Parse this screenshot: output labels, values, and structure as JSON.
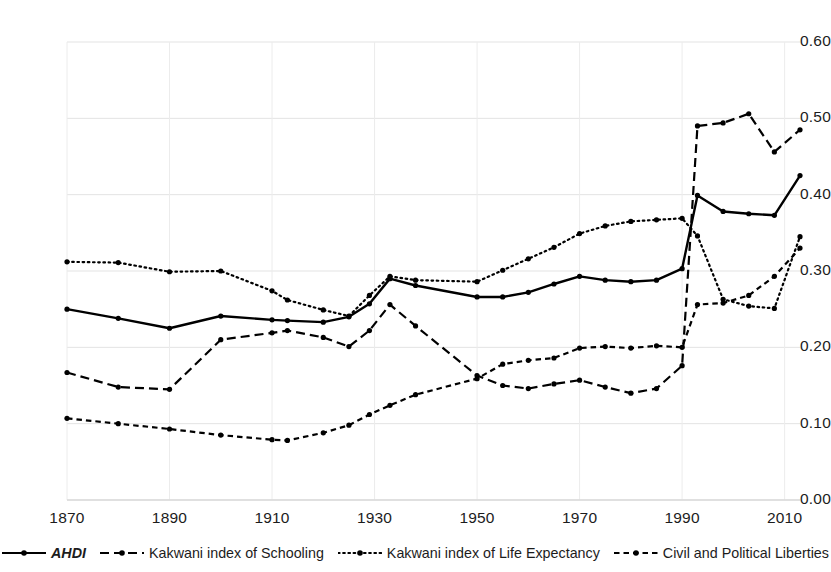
{
  "chart_data": {
    "type": "line",
    "title": "",
    "subtitle": "",
    "xlabel": "",
    "ylabel": "",
    "xlim": [
      1870,
      2013
    ],
    "ylim": [
      0.0,
      0.6
    ],
    "grid": true,
    "legend_position": "bottom",
    "y_ticks": [
      "0.00",
      "0.10",
      "0.20",
      "0.30",
      "0.40",
      "0.50",
      "0.60"
    ],
    "y_tick_values": [
      0.0,
      0.1,
      0.2,
      0.3,
      0.4,
      0.5,
      0.6
    ],
    "x_ticks": [
      "1870",
      "1890",
      "1910",
      "1930",
      "1950",
      "1970",
      "1990",
      "2010"
    ],
    "x_tick_values": [
      1870,
      1890,
      1910,
      1930,
      1950,
      1970,
      1990,
      2010
    ],
    "x": [
      1870,
      1880,
      1890,
      1900,
      1910,
      1913,
      1920,
      1925,
      1929,
      1933,
      1938,
      1950,
      1955,
      1960,
      1965,
      1970,
      1975,
      1980,
      1985,
      1990,
      1993,
      1998,
      2003,
      2008,
      2013
    ],
    "series": [
      {
        "name": "AHDI",
        "style": "solid",
        "marker": "circle",
        "color": "#000000",
        "values": [
          0.25,
          0.238,
          0.225,
          0.241,
          0.236,
          0.235,
          0.233,
          0.24,
          0.257,
          0.29,
          0.281,
          0.266,
          0.266,
          0.272,
          0.283,
          0.293,
          0.288,
          0.286,
          0.288,
          0.303,
          0.399,
          0.378,
          0.375,
          0.373,
          0.425
        ]
      },
      {
        "name": "Kakwani index of Schooling",
        "style": "dashed",
        "marker": "circle",
        "color": "#000000",
        "values": [
          0.167,
          0.148,
          0.145,
          0.21,
          0.219,
          0.222,
          0.213,
          0.201,
          0.222,
          0.256,
          0.228,
          0.163,
          0.15,
          0.146,
          0.152,
          0.157,
          0.148,
          0.14,
          0.146,
          0.176,
          0.49,
          0.494,
          0.506,
          0.456,
          0.485
        ]
      },
      {
        "name": "Kakwani index of Life Expectancy",
        "style": "dotted",
        "marker": "circle",
        "color": "#000000",
        "values": [
          0.312,
          0.311,
          0.299,
          0.3,
          0.274,
          0.262,
          0.249,
          0.241,
          0.268,
          0.293,
          0.288,
          0.286,
          0.301,
          0.316,
          0.331,
          0.349,
          0.359,
          0.365,
          0.367,
          0.369,
          0.346,
          0.263,
          0.254,
          0.251,
          0.345
        ]
      },
      {
        "name": "Civil and Political Liberties",
        "style": "short-dash",
        "marker": "circle",
        "color": "#000000",
        "values": [
          0.107,
          0.1,
          0.093,
          0.085,
          0.079,
          0.078,
          0.088,
          0.098,
          0.112,
          0.124,
          0.138,
          0.159,
          0.178,
          0.183,
          0.186,
          0.199,
          0.201,
          0.199,
          0.202,
          0.2,
          0.256,
          0.258,
          0.268,
          0.293,
          0.33
        ]
      }
    ]
  },
  "legend": {
    "items": [
      {
        "label": "AHDI",
        "style": "solid",
        "italic": true
      },
      {
        "label": "Kakwani index of Schooling",
        "style": "dashed",
        "italic": false
      },
      {
        "label": "Kakwani index of Life Expectancy",
        "style": "dotted",
        "italic": false
      },
      {
        "label": "Civil and Political Liberties",
        "style": "short-dash",
        "italic": false
      }
    ]
  }
}
